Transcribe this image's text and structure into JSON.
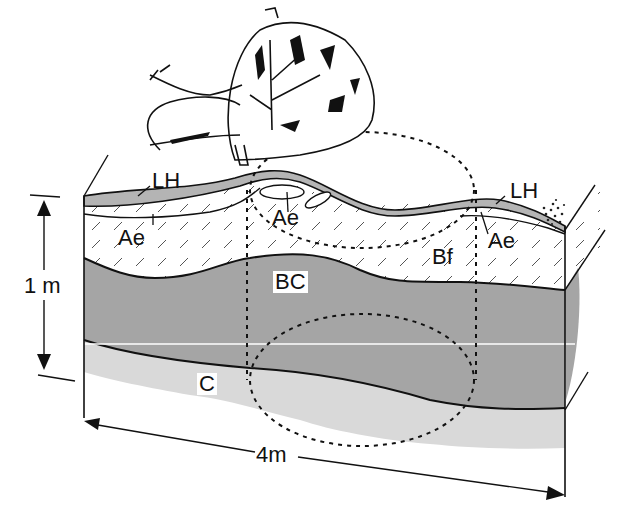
{
  "diagram": {
    "type": "soil-profile-block-diagram",
    "horizons": [
      {
        "id": "LH",
        "label": "LH",
        "description": "surface organic layer",
        "fill": "#b4b4b4"
      },
      {
        "id": "Ae",
        "label": "Ae",
        "description": "eluviated horizon (hatched)",
        "fill": "#ffffff"
      },
      {
        "id": "Bf",
        "label": "Bf",
        "description": "iron-enriched B horizon (hatched)",
        "fill": "#ffffff"
      },
      {
        "id": "BC",
        "label": "BC",
        "description": "transition horizon",
        "fill": "#a5a5a5"
      },
      {
        "id": "C",
        "label": "C",
        "description": "parent material",
        "fill": "#d9d9d9"
      }
    ],
    "labels": {
      "lh_left": "LH",
      "lh_right": "LH",
      "ae_left": "Ae",
      "ae_center": "Ae",
      "ae_right": "Ae",
      "bf": "Bf",
      "bc": "BC",
      "c": "C"
    },
    "dimensions": {
      "depth_label": "1 m",
      "width_label": "4m"
    },
    "features": [
      {
        "name": "uprooted-tree",
        "description": "fallen tree with root plate"
      },
      {
        "name": "pit-mound-zone-upper",
        "style": "dashed-ellipse"
      },
      {
        "name": "pit-mound-zone-lower",
        "style": "dashed-ellipse"
      }
    ],
    "colors": {
      "line": "#111111",
      "lh": "#b4b4b4",
      "bc": "#a5a5a5",
      "c": "#d9d9d9",
      "background": "#ffffff"
    }
  }
}
